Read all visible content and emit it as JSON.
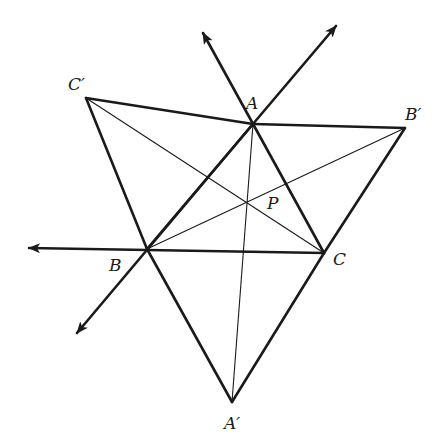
{
  "diagram": {
    "type": "geometry-construction",
    "colors": {
      "stroke": "#1a1a1a",
      "background": "#ffffff"
    },
    "points": {
      "A": {
        "label": "A",
        "x": 253,
        "y": 124
      },
      "B": {
        "label": "B",
        "x": 147,
        "y": 249
      },
      "C": {
        "label": "C",
        "x": 324,
        "y": 253
      },
      "Ap": {
        "label": "A′",
        "x": 232,
        "y": 402
      },
      "Bp": {
        "label": "B′",
        "x": 405,
        "y": 128
      },
      "Cp": {
        "label": "C′",
        "x": 86,
        "y": 98
      },
      "P": {
        "label": "P",
        "x": 247,
        "y": 203
      }
    },
    "labels": {
      "A": "A",
      "B": "B",
      "C": "C",
      "A_prime": "A′",
      "B_prime": "B′",
      "C_prime": "C′",
      "P": "P"
    },
    "rays": [
      {
        "name": "ray-CA-extended",
        "from": "C",
        "tip": [
          203,
          33
        ]
      },
      {
        "name": "ray-BA-extended",
        "from": "B",
        "tip": [
          336,
          26
        ]
      },
      {
        "name": "ray-CB-extended",
        "from": "C",
        "tip": [
          29,
          248
        ]
      },
      {
        "name": "ray-AB-extended",
        "from": "A",
        "tip": [
          77,
          333
        ]
      }
    ],
    "segments_thick": [
      [
        "Cp",
        "A"
      ],
      [
        "A",
        "Bp"
      ],
      [
        "Cp",
        "B"
      ],
      [
        "B",
        "Ap"
      ],
      [
        "Ap",
        "C"
      ],
      [
        "C",
        "Bp"
      ]
    ],
    "segments_thin": [
      [
        "A",
        "Ap"
      ],
      [
        "B",
        "Bp"
      ],
      [
        "C",
        "Cp"
      ]
    ]
  }
}
